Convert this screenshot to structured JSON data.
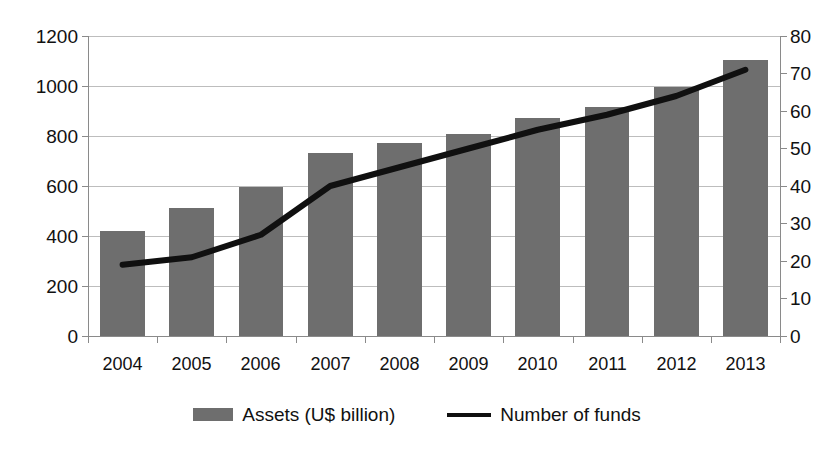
{
  "chart_data": {
    "type": "bar",
    "title": "",
    "subtitle": "",
    "xlabel": "",
    "ylabel": "",
    "categories": [
      "2004",
      "2005",
      "2006",
      "2007",
      "2008",
      "2009",
      "2010",
      "2011",
      "2012",
      "2013"
    ],
    "series": [
      {
        "name": "Assets (U$ billion)",
        "type": "bar",
        "axis": "left",
        "color": "#6e6e6e",
        "values": [
          420,
          512,
          596,
          734,
          772,
          810,
          872,
          918,
          996,
          1104
        ]
      },
      {
        "name": "Number of funds",
        "type": "line",
        "axis": "right",
        "color": "#101010",
        "values": [
          19,
          21,
          27,
          40,
          45,
          50,
          55,
          59,
          64,
          71
        ]
      }
    ],
    "axes": {
      "left": {
        "min": 0,
        "max": 1200,
        "step": 200,
        "ticks": [
          "0",
          "200",
          "400",
          "600",
          "800",
          "1000",
          "1200"
        ]
      },
      "right": {
        "min": 0,
        "max": 80,
        "step": 10,
        "ticks": [
          "0",
          "10",
          "20",
          "30",
          "40",
          "50",
          "60",
          "70",
          "80"
        ]
      },
      "bottom": {
        "ticks": [
          "2004",
          "2005",
          "2006",
          "2007",
          "2008",
          "2009",
          "2010",
          "2011",
          "2012",
          "2013"
        ]
      }
    },
    "grid": true,
    "legend": {
      "position": "bottom",
      "entries": [
        {
          "label": "Assets (U$ billion)",
          "marker": "bar-swatch",
          "color": "#6e6e6e"
        },
        {
          "label": "Number of funds",
          "marker": "line-swatch",
          "color": "#101010"
        }
      ]
    }
  }
}
